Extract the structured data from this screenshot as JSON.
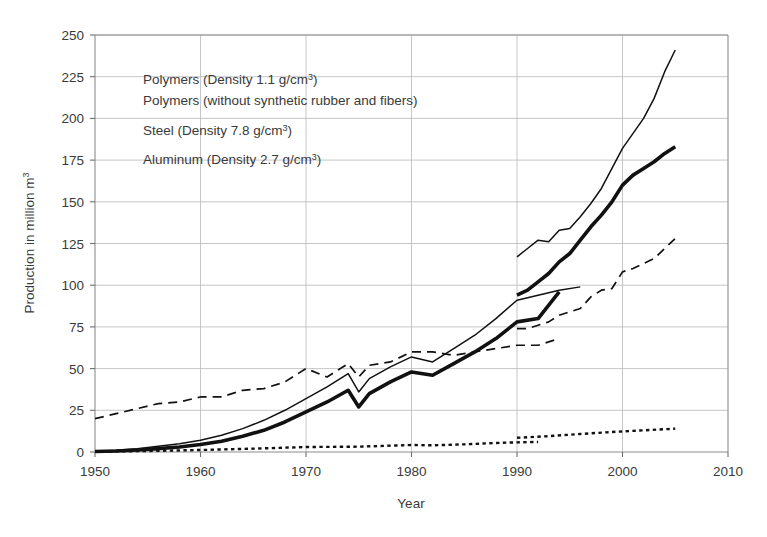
{
  "figure": {
    "background_color": "#ffffff",
    "ink_color": "#111111",
    "grid_color": "#b8b8b8",
    "axis_color": "#8c8c8c",
    "text_color": "#3a3a3a"
  },
  "axes": {
    "x_title": "Year",
    "y_title_plain": "Production in million m3",
    "y_title_base": "Production in million m",
    "y_title_exponent": "3",
    "x_ticks": [
      "1950",
      "1960",
      "1970",
      "1980",
      "1990",
      "2000",
      "2010"
    ],
    "y_ticks": [
      "0",
      "25",
      "50",
      "75",
      "100",
      "125",
      "150",
      "175",
      "200",
      "225",
      "250"
    ]
  },
  "legend": {
    "position": "upper-left-inside",
    "entries": [
      {
        "key": "polymers_total",
        "label": "Polymers (Density 1.1 g/cm3)",
        "label_base": "Polymers (Density 1.1 g/cm",
        "label_sup": "3",
        "label_tail": ")",
        "style": "thin-solid"
      },
      {
        "key": "polymers_net",
        "label": "Polymers (without synthetic rubber and fibers)",
        "label_base": "Polymers (without synthetic rubber and fibers)",
        "label_sup": "",
        "label_tail": "",
        "style": "thick-solid"
      },
      {
        "key": "steel",
        "label": "Steel (Density 7.8 g/cm3)",
        "label_base": "Steel (Density 7.8 g/cm",
        "label_sup": "3",
        "label_tail": ")",
        "style": "long-dash"
      },
      {
        "key": "aluminum",
        "label": "Aluminum (Density 2.7 g/cm3)",
        "label_base": "Aluminum (Density 2.7 g/cm",
        "label_sup": "3",
        "label_tail": ")",
        "style": "short-dash"
      }
    ]
  },
  "chart_data": {
    "type": "line",
    "title": "",
    "subtitle": "",
    "xlabel": "Year",
    "ylabel": "Production in million m3",
    "xlim": [
      1950,
      2010
    ],
    "ylim": [
      0,
      250
    ],
    "xticks": [
      1950,
      1960,
      1970,
      1980,
      1990,
      2000,
      2010
    ],
    "yticks": [
      0,
      25,
      50,
      75,
      100,
      125,
      150,
      175,
      200,
      225,
      250
    ],
    "grid": true,
    "legend_position": "upper left (inside plot)",
    "series": [
      {
        "name": "Polymers (Density 1.1 g/cm3)",
        "style": "thin solid",
        "segment": "early",
        "x": [
          1950,
          1952,
          1954,
          1956,
          1958,
          1960,
          1962,
          1964,
          1966,
          1968,
          1970,
          1972,
          1974,
          1975,
          1976,
          1978,
          1980,
          1982,
          1984,
          1986,
          1988,
          1990,
          1992,
          1994,
          1996
        ],
        "y": [
          0.5,
          1,
          2,
          3.5,
          5,
          7,
          10,
          14,
          19,
          25,
          32,
          39,
          47,
          36,
          44,
          51,
          57,
          54,
          62,
          70,
          80,
          91,
          94,
          97,
          99
        ]
      },
      {
        "name": "Polymers (Density 1.1 g/cm3)",
        "style": "thin solid",
        "segment": "late",
        "x": [
          1990,
          1991,
          1992,
          1993,
          1994,
          1995,
          1996,
          1997,
          1998,
          1999,
          2000,
          2001,
          2002,
          2003,
          2004,
          2005
        ],
        "y": [
          117,
          122,
          127,
          126,
          133,
          134,
          141,
          149,
          158,
          170,
          182,
          191,
          200,
          212,
          228,
          241
        ]
      },
      {
        "name": "Polymers (without synthetic rubber and fibers)",
        "style": "thick solid",
        "segment": "early",
        "x": [
          1950,
          1952,
          1954,
          1956,
          1958,
          1960,
          1962,
          1964,
          1966,
          1968,
          1970,
          1972,
          1974,
          1975,
          1976,
          1978,
          1980,
          1982,
          1984,
          1986,
          1988,
          1990,
          1992,
          1994
        ],
        "y": [
          0.3,
          0.6,
          1.2,
          2,
          3,
          4.5,
          6.5,
          9.5,
          13,
          18,
          24,
          30,
          37,
          27,
          35,
          42,
          48,
          46,
          53,
          60,
          68,
          78,
          80,
          96
        ]
      },
      {
        "name": "Polymers (without synthetic rubber and fibers)",
        "style": "thick solid",
        "segment": "late",
        "x": [
          1990,
          1991,
          1992,
          1993,
          1994,
          1995,
          1996,
          1997,
          1998,
          1999,
          2000,
          2001,
          2002,
          2003,
          2004,
          2005
        ],
        "y": [
          94,
          97,
          102,
          107,
          114,
          119,
          127,
          135,
          142,
          150,
          160,
          166,
          170,
          174,
          179,
          183
        ]
      },
      {
        "name": "Steel (Density 7.8 g/cm3)",
        "style": "long dashed",
        "segment": "early",
        "x": [
          1950,
          1952,
          1954,
          1956,
          1958,
          1960,
          1962,
          1964,
          1966,
          1968,
          1970,
          1972,
          1974,
          1975,
          1976,
          1978,
          1980,
          1982,
          1984,
          1986,
          1988,
          1990,
          1992,
          1994
        ],
        "y": [
          20,
          23,
          26,
          29,
          30,
          33,
          33,
          37,
          38,
          42,
          50,
          45,
          53,
          45,
          52,
          54,
          60,
          60,
          58,
          60,
          62,
          64,
          64,
          68
        ]
      },
      {
        "name": "Steel (Density 7.8 g/cm3)",
        "style": "long dashed",
        "segment": "late",
        "x": [
          1990,
          1991,
          1992,
          1993,
          1994,
          1995,
          1996,
          1997,
          1998,
          1999,
          2000,
          2001,
          2002,
          2003,
          2004,
          2005
        ],
        "y": [
          74,
          74,
          76,
          78,
          82,
          84,
          86,
          93,
          97,
          98,
          108,
          110,
          113,
          116,
          122,
          128
        ]
      },
      {
        "name": "Aluminum (Density 2.7 g/cm3)",
        "style": "short dashed",
        "segment": "early",
        "x": [
          1950,
          1955,
          1960,
          1965,
          1970,
          1975,
          1980,
          1982,
          1985,
          1988,
          1990,
          1992
        ],
        "y": [
          0.2,
          0.6,
          1.2,
          2,
          3,
          3.2,
          4.2,
          4,
          4.6,
          5.4,
          5.8,
          6
        ]
      },
      {
        "name": "Aluminum (Density 2.7 g/cm3)",
        "style": "short dashed",
        "segment": "late",
        "x": [
          1990,
          1993,
          1996,
          1999,
          2002,
          2005
        ],
        "y": [
          8.5,
          9.5,
          10.8,
          12,
          13,
          14
        ]
      }
    ]
  }
}
